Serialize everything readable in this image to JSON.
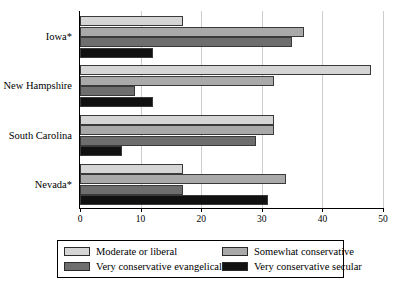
{
  "chart_data": {
    "type": "bar",
    "orientation": "horizontal",
    "title": "",
    "xlabel": "",
    "ylabel": "",
    "xlim": [
      0,
      50
    ],
    "xticks": [
      0,
      10,
      20,
      30,
      40,
      50
    ],
    "grid": true,
    "grid_axis": "x",
    "legend_position": "bottom",
    "categories": [
      "Iowa*",
      "New Hampshire",
      "South Carolina",
      "Nevada*"
    ],
    "series": [
      {
        "name": "Moderate or liberal",
        "color": "#d5d5d5",
        "values": [
          17,
          48,
          32,
          17
        ]
      },
      {
        "name": "Somewhat conservative",
        "color": "#a9a9a9",
        "values": [
          37,
          32,
          32,
          34
        ]
      },
      {
        "name": "Very conservative evangelical",
        "color": "#6e6e6e",
        "values": [
          35,
          9,
          29,
          17
        ]
      },
      {
        "name": "Very conservative secular",
        "color": "#111111",
        "values": [
          12,
          12,
          7,
          31
        ]
      }
    ]
  },
  "axis": {
    "tick_labels": [
      "0",
      "10",
      "20",
      "30",
      "40",
      "50"
    ]
  },
  "legend": {
    "items": [
      {
        "label": "Moderate or liberal",
        "color": "#d5d5d5"
      },
      {
        "label": "Somewhat conservative",
        "color": "#a9a9a9"
      },
      {
        "label": "Very conservative evangelical",
        "color": "#6e6e6e"
      },
      {
        "label": "Very conservative secular",
        "color": "#111111"
      }
    ]
  }
}
